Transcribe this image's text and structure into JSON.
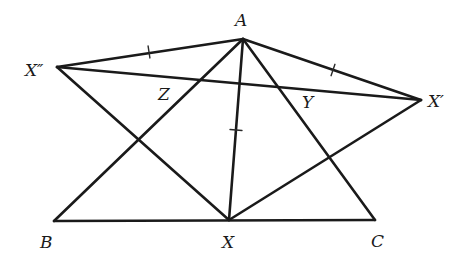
{
  "diagram": {
    "type": "geometry-figure",
    "stroke_color": "#1a1a1a",
    "background": "#ffffff",
    "points": {
      "A": {
        "x": 243,
        "y": 39
      },
      "B": {
        "x": 54,
        "y": 221
      },
      "C": {
        "x": 375,
        "y": 220
      },
      "X": {
        "x": 229,
        "y": 220
      },
      "X1": {
        "x": 421,
        "y": 100
      },
      "X2": {
        "x": 57,
        "y": 67
      }
    },
    "segments": [
      {
        "name": "AB",
        "from": "A",
        "to": "B"
      },
      {
        "name": "AC",
        "from": "A",
        "to": "C"
      },
      {
        "name": "BC",
        "from": "B",
        "to": "C"
      },
      {
        "name": "AX",
        "from": "A",
        "to": "X"
      },
      {
        "name": "AX-prime",
        "from": "A",
        "to": "X1"
      },
      {
        "name": "AX-double-prime",
        "from": "A",
        "to": "X2"
      },
      {
        "name": "X-prime-X-double-prime",
        "from": "X1",
        "to": "X2"
      },
      {
        "name": "XX-prime",
        "from": "X",
        "to": "X1"
      },
      {
        "name": "XX-double-prime",
        "from": "X",
        "to": "X2"
      }
    ],
    "equal_length_ticks": [
      {
        "segment": "AX-double-prime",
        "x": 149,
        "y": 52
      },
      {
        "segment": "AX-prime",
        "x": 333,
        "y": 70
      },
      {
        "segment": "AX",
        "x": 236,
        "y": 130
      }
    ],
    "labels": {
      "A": {
        "text": "A",
        "x": 235,
        "y": 26
      },
      "B": {
        "text": "B",
        "x": 40,
        "y": 248
      },
      "C": {
        "text": "C",
        "x": 371,
        "y": 247
      },
      "X": {
        "text": "X",
        "x": 222,
        "y": 248
      },
      "X_prime": {
        "text": "X′",
        "x": 428,
        "y": 107
      },
      "X_double_prime": {
        "text": "X″",
        "x": 25,
        "y": 76
      },
      "Y": {
        "text": "Y",
        "x": 302,
        "y": 108
      },
      "Z": {
        "text": "Z",
        "x": 158,
        "y": 100
      }
    }
  }
}
